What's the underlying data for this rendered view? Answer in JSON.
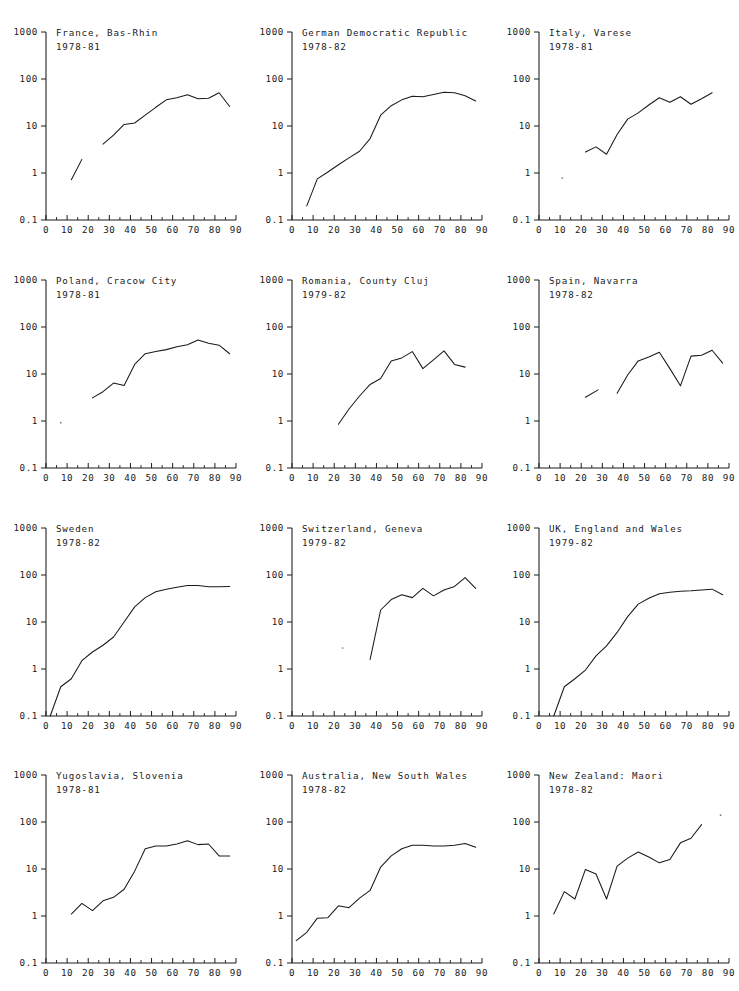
{
  "figure": {
    "layout": "3 columns x 4 rows",
    "panel_count": 12,
    "axis": {
      "y_scale": "log",
      "y_ticks": [
        "1000",
        "100",
        "10",
        "1",
        "0.1"
      ],
      "y_tick_values": [
        1000,
        100,
        10,
        1,
        0.1
      ],
      "ylim": [
        0.1,
        1000
      ],
      "x_scale": "linear",
      "x_ticks": [
        "0",
        "10",
        "20",
        "30",
        "40",
        "50",
        "60",
        "70",
        "80",
        "90"
      ],
      "x_tick_values": [
        0,
        10,
        20,
        30,
        40,
        50,
        60,
        70,
        80,
        90
      ],
      "x_minor_step": 5,
      "xlim": [
        0,
        90
      ],
      "xlabel": "",
      "ylabel": "",
      "grid": false,
      "legend": "none"
    },
    "colors": {
      "line": "#1a1a1a",
      "axis": "#1a1a1a",
      "text": "#1a1a1a",
      "background": "#ffffff"
    }
  },
  "chart_data": [
    {
      "type": "line",
      "title": "France, Bas-Rhin",
      "subtitle": "1978-81",
      "xlabel": "",
      "ylabel": "",
      "xlim": [
        0,
        90
      ],
      "ylim": [
        0.1,
        1000
      ],
      "segments": [
        {
          "x": [
            12,
            17
          ],
          "y": [
            0.72,
            1.95
          ]
        },
        {
          "x": [
            27,
            32,
            37,
            42,
            47,
            52,
            57,
            62,
            67,
            72,
            77,
            82,
            87
          ],
          "y": [
            4.1,
            6.4,
            10.8,
            11.6,
            17.0,
            25.0,
            36.0,
            40.0,
            46.0,
            38.0,
            39.0,
            51.0,
            26.0
          ]
        }
      ]
    },
    {
      "type": "line",
      "title": "German Democratic Republic",
      "subtitle": "1978-82",
      "xlabel": "",
      "ylabel": "",
      "xlim": [
        0,
        90
      ],
      "ylim": [
        0.1,
        1000
      ],
      "segments": [
        {
          "x": [
            7,
            12,
            17,
            22,
            27,
            32,
            37,
            42,
            47,
            52,
            57,
            62,
            67,
            72,
            77,
            82,
            87
          ],
          "y": [
            0.2,
            0.75,
            1.05,
            1.5,
            2.1,
            2.9,
            5.4,
            17.0,
            27.0,
            36.0,
            43.0,
            42.0,
            47.0,
            52.0,
            51.0,
            44.0,
            34.0
          ]
        }
      ]
    },
    {
      "type": "line",
      "title": "Italy, Varese",
      "subtitle": "1978-81",
      "xlabel": "",
      "ylabel": "",
      "xlim": [
        0,
        90
      ],
      "ylim": [
        0.1,
        1000
      ],
      "segments": [
        {
          "x": [
            22,
            27,
            32,
            37,
            42,
            47,
            52,
            57,
            62,
            67,
            72,
            77,
            82
          ],
          "y": [
            2.8,
            3.6,
            2.5,
            6.6,
            14.0,
            19.0,
            28.0,
            40.0,
            32.0,
            42.0,
            29.0,
            38.0,
            51.0
          ]
        }
      ],
      "stray_points": [
        {
          "x": 11,
          "y": 0.78
        }
      ]
    },
    {
      "type": "line",
      "title": "Poland, Cracow City",
      "subtitle": "1978-81",
      "xlabel": "",
      "ylabel": "",
      "xlim": [
        0,
        90
      ],
      "ylim": [
        0.1,
        1000
      ],
      "segments": [
        {
          "x": [
            22,
            27,
            32,
            37,
            42,
            47,
            52,
            57,
            62,
            67,
            72,
            77,
            82,
            87
          ],
          "y": [
            3.1,
            4.2,
            6.4,
            5.7,
            16.0,
            27.0,
            30.0,
            33.0,
            38.0,
            42.0,
            53.0,
            45.0,
            41.0,
            27.0
          ]
        }
      ],
      "stray_points": [
        {
          "x": 7,
          "y": 0.92
        }
      ]
    },
    {
      "type": "line",
      "title": "Romania, County Cluj",
      "subtitle": "1979-82",
      "xlabel": "",
      "ylabel": "",
      "xlim": [
        0,
        90
      ],
      "ylim": [
        0.1,
        1000
      ],
      "segments": [
        {
          "x": [
            22,
            27,
            32,
            37,
            42,
            47,
            52,
            57,
            62,
            67,
            72,
            77,
            82
          ],
          "y": [
            0.85,
            1.8,
            3.4,
            6.0,
            8.0,
            19.0,
            22.0,
            30.0,
            13.0,
            20.0,
            31.0,
            16.0,
            14.0
          ]
        }
      ]
    },
    {
      "type": "line",
      "title": "Spain, Navarra",
      "subtitle": "1978-82",
      "xlabel": "",
      "ylabel": "",
      "xlim": [
        0,
        90
      ],
      "ylim": [
        0.1,
        1000
      ],
      "segments": [
        {
          "x": [
            22,
            28
          ],
          "y": [
            3.2,
            4.6
          ]
        },
        {
          "x": [
            37,
            42,
            47,
            52,
            57,
            62,
            67,
            72,
            77,
            82,
            87
          ],
          "y": [
            3.9,
            9.5,
            19.0,
            23.0,
            29.0,
            13.0,
            5.6,
            24.0,
            25.0,
            32.0,
            17.0
          ]
        }
      ]
    },
    {
      "type": "line",
      "title": "Sweden",
      "subtitle": "1978-82",
      "xlabel": "",
      "ylabel": "",
      "xlim": [
        0,
        90
      ],
      "ylim": [
        0.1,
        1000
      ],
      "segments": [
        {
          "x": [
            2,
            7,
            12,
            17,
            22,
            27,
            32,
            37,
            42,
            47,
            52,
            57,
            62,
            67,
            72,
            77,
            82,
            87
          ],
          "y": [
            0.1,
            0.42,
            0.62,
            1.5,
            2.3,
            3.2,
            4.8,
            10.0,
            21.0,
            33.0,
            44.0,
            50.0,
            55.0,
            60.0,
            60.0,
            56.0,
            56.0,
            57.0
          ]
        }
      ]
    },
    {
      "type": "line",
      "title": "Switzerland, Geneva",
      "subtitle": "1979-82",
      "xlabel": "",
      "ylabel": "",
      "xlim": [
        0,
        90
      ],
      "ylim": [
        0.1,
        1000
      ],
      "segments": [
        {
          "x": [
            37,
            42,
            47,
            52,
            57,
            62,
            67,
            72,
            77,
            82,
            87
          ],
          "y": [
            1.6,
            18.0,
            30.0,
            38.0,
            33.0,
            52.0,
            36.0,
            48.0,
            57.0,
            88.0,
            52.0
          ]
        }
      ],
      "stray_points": [
        {
          "x": 24,
          "y": 2.8
        }
      ]
    },
    {
      "type": "line",
      "title": "UK, England and Wales",
      "subtitle": "1979-82",
      "xlabel": "",
      "ylabel": "",
      "xlim": [
        0,
        90
      ],
      "ylim": [
        0.1,
        1000
      ],
      "segments": [
        {
          "x": [
            7,
            12,
            17,
            22,
            27,
            32,
            37,
            42,
            47,
            52,
            57,
            62,
            67,
            72,
            77,
            82,
            87
          ],
          "y": [
            0.1,
            0.42,
            0.62,
            0.95,
            1.9,
            3.1,
            6.0,
            13.0,
            24.0,
            32.0,
            40.0,
            43.0,
            45.0,
            46.0,
            48.0,
            50.0,
            38.0
          ]
        }
      ]
    },
    {
      "type": "line",
      "title": "Yugoslavia, Slovenia",
      "subtitle": "1978-81",
      "xlabel": "",
      "ylabel": "",
      "xlim": [
        0,
        90
      ],
      "ylim": [
        0.1,
        1000
      ],
      "segments": [
        {
          "x": [
            12,
            17,
            22,
            27,
            32,
            37,
            42,
            47,
            52,
            57,
            62,
            67,
            72,
            77,
            82,
            87
          ],
          "y": [
            1.1,
            1.85,
            1.3,
            2.1,
            2.5,
            3.7,
            9.0,
            27.0,
            31.0,
            31.0,
            34.0,
            40.0,
            33.0,
            34.0,
            19.0,
            19.0
          ]
        }
      ]
    },
    {
      "type": "line",
      "title": "Australia, New South Wales",
      "subtitle": "1978-82",
      "xlabel": "",
      "ylabel": "",
      "xlim": [
        0,
        90
      ],
      "ylim": [
        0.1,
        1000
      ],
      "segments": [
        {
          "x": [
            2,
            7,
            12,
            17,
            22,
            27,
            32,
            37,
            42,
            47,
            52,
            57,
            62,
            67,
            72,
            77,
            82,
            87
          ],
          "y": [
            0.3,
            0.45,
            0.9,
            0.92,
            1.65,
            1.5,
            2.4,
            3.5,
            11.0,
            19.0,
            27.0,
            32.0,
            32.0,
            31.0,
            31.0,
            32.0,
            35.0,
            29.0
          ]
        }
      ]
    },
    {
      "type": "line",
      "title": "New Zealand: Maori",
      "subtitle": "1978-82",
      "xlabel": "",
      "ylabel": "",
      "xlim": [
        0,
        90
      ],
      "ylim": [
        0.1,
        1000
      ],
      "segments": [
        {
          "x": [
            7,
            12,
            17,
            22,
            27,
            32,
            37,
            42,
            47,
            52,
            57,
            62,
            67,
            72,
            77
          ],
          "y": [
            1.1,
            3.3,
            2.3,
            9.8,
            7.8,
            2.3,
            11.5,
            17.0,
            23.0,
            18.0,
            13.5,
            16.0,
            36.0,
            45.0,
            88.0
          ]
        }
      ],
      "stray_points": [
        {
          "x": 86,
          "y": 140
        }
      ]
    }
  ]
}
